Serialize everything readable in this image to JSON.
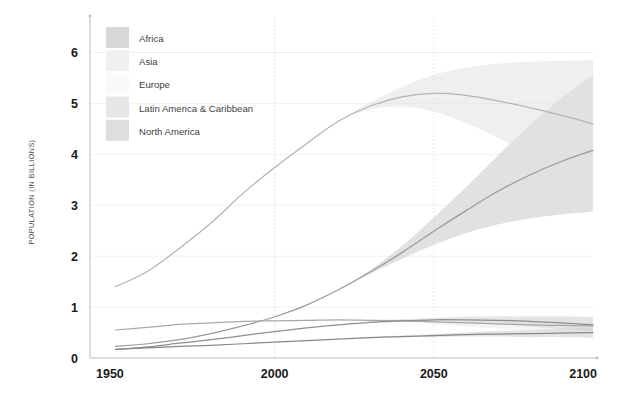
{
  "chart_data": {
    "type": "area",
    "title": "",
    "subtitle": "",
    "xlabel": "",
    "ylabel": "POPULATION (IN BILLIONS)",
    "xlim": [
      1942,
      2100
    ],
    "ylim": [
      0,
      6.6
    ],
    "xticks": [
      "1950",
      "2000",
      "2050",
      "2100"
    ],
    "xtick_values": [
      1950,
      2000,
      2050,
      2100
    ],
    "yticks": [
      "0",
      "1",
      "2",
      "3",
      "4",
      "5",
      "6"
    ],
    "ytick_values": [
      0,
      1,
      2,
      3,
      4,
      5,
      6
    ],
    "grid": "dotted vertical at 2000 and 2050; faint horizontal at 1-6",
    "legend_position": "top-left inside plot",
    "projection_start": 2022,
    "series": [
      {
        "name": "Africa",
        "color": "#9a9a9a",
        "band_color": "#c9c9c9",
        "x": [
          1950,
          1960,
          1970,
          1980,
          1990,
          2000,
          2010,
          2020,
          2030,
          2040,
          2050,
          2060,
          2070,
          2080,
          2090,
          2100
        ],
        "values": [
          0.23,
          0.28,
          0.36,
          0.48,
          0.63,
          0.81,
          1.04,
          1.34,
          1.69,
          2.07,
          2.49,
          2.89,
          3.27,
          3.59,
          3.86,
          4.08
        ],
        "band_low": [
          0.23,
          0.28,
          0.36,
          0.48,
          0.63,
          0.81,
          1.04,
          1.34,
          1.65,
          1.95,
          2.22,
          2.45,
          2.62,
          2.74,
          2.82,
          2.88
        ],
        "band_high": [
          0.23,
          0.28,
          0.36,
          0.48,
          0.63,
          0.81,
          1.04,
          1.34,
          1.73,
          2.2,
          2.76,
          3.35,
          3.97,
          4.56,
          5.1,
          5.56
        ]
      },
      {
        "name": "Asia",
        "color": "#b4b4b4",
        "band_color": "#e2e2e2",
        "x": [
          1950,
          1960,
          1970,
          1980,
          1990,
          2000,
          2010,
          2020,
          2030,
          2040,
          2050,
          2060,
          2070,
          2080,
          2090,
          2100
        ],
        "values": [
          1.4,
          1.7,
          2.15,
          2.65,
          3.23,
          3.74,
          4.21,
          4.65,
          4.95,
          5.13,
          5.2,
          5.16,
          5.05,
          4.92,
          4.77,
          4.6
        ],
        "band_low": [
          1.4,
          1.7,
          2.15,
          2.65,
          3.23,
          3.74,
          4.21,
          4.65,
          4.88,
          4.94,
          4.84,
          4.62,
          4.33,
          4.0,
          3.66,
          3.32
        ],
        "band_high": [
          1.4,
          1.7,
          2.15,
          2.65,
          3.23,
          3.74,
          4.21,
          4.65,
          5.02,
          5.32,
          5.56,
          5.7,
          5.78,
          5.82,
          5.84,
          5.85
        ]
      },
      {
        "name": "Europe",
        "color": "#a8a8a8",
        "band_color": "#ececec",
        "x": [
          1950,
          1960,
          1970,
          1980,
          1990,
          2000,
          2010,
          2020,
          2030,
          2040,
          2050,
          2060,
          2070,
          2080,
          2090,
          2100
        ],
        "values": [
          0.55,
          0.6,
          0.66,
          0.69,
          0.72,
          0.73,
          0.74,
          0.75,
          0.74,
          0.73,
          0.71,
          0.69,
          0.67,
          0.65,
          0.64,
          0.63
        ],
        "band_low": [
          0.55,
          0.6,
          0.66,
          0.69,
          0.72,
          0.73,
          0.74,
          0.75,
          0.73,
          0.7,
          0.66,
          0.62,
          0.58,
          0.54,
          0.51,
          0.48
        ],
        "band_high": [
          0.55,
          0.6,
          0.66,
          0.69,
          0.72,
          0.73,
          0.74,
          0.75,
          0.76,
          0.76,
          0.76,
          0.77,
          0.77,
          0.78,
          0.79,
          0.8
        ]
      },
      {
        "name": "Latin America & Caribbean",
        "color": "#8f8f8f",
        "band_color": "#d3d3d3",
        "x": [
          1950,
          1960,
          1970,
          1980,
          1990,
          2000,
          2010,
          2020,
          2030,
          2040,
          2050,
          2060,
          2070,
          2080,
          2090,
          2100
        ],
        "values": [
          0.17,
          0.22,
          0.29,
          0.36,
          0.44,
          0.52,
          0.59,
          0.65,
          0.7,
          0.73,
          0.75,
          0.75,
          0.74,
          0.72,
          0.69,
          0.65
        ],
        "band_low": [
          0.17,
          0.22,
          0.29,
          0.36,
          0.44,
          0.52,
          0.59,
          0.65,
          0.69,
          0.71,
          0.71,
          0.69,
          0.66,
          0.62,
          0.57,
          0.52
        ],
        "band_high": [
          0.17,
          0.22,
          0.29,
          0.36,
          0.44,
          0.52,
          0.59,
          0.65,
          0.71,
          0.76,
          0.79,
          0.81,
          0.82,
          0.82,
          0.82,
          0.81
        ]
      },
      {
        "name": "North America",
        "color": "#888888",
        "band_color": "#cfcfcf",
        "x": [
          1950,
          1960,
          1970,
          1980,
          1990,
          2000,
          2010,
          2020,
          2030,
          2040,
          2050,
          2060,
          2070,
          2080,
          2090,
          2100
        ],
        "values": [
          0.17,
          0.2,
          0.23,
          0.25,
          0.28,
          0.31,
          0.34,
          0.37,
          0.4,
          0.42,
          0.44,
          0.46,
          0.47,
          0.48,
          0.49,
          0.5
        ],
        "band_low": [
          0.17,
          0.2,
          0.23,
          0.25,
          0.28,
          0.31,
          0.34,
          0.37,
          0.39,
          0.41,
          0.41,
          0.42,
          0.42,
          0.41,
          0.41,
          0.4
        ],
        "band_high": [
          0.17,
          0.2,
          0.23,
          0.25,
          0.28,
          0.31,
          0.34,
          0.37,
          0.41,
          0.44,
          0.47,
          0.5,
          0.53,
          0.55,
          0.58,
          0.6
        ]
      }
    ]
  },
  "legend": {
    "items": [
      {
        "label": "Africa",
        "swatch": "#d7d7d7"
      },
      {
        "label": "Asia",
        "swatch": "#f0f0f0"
      },
      {
        "label": "Europe",
        "swatch": "#fafafa"
      },
      {
        "label": "Latin America & Caribbean",
        "swatch": "#e6e6e6"
      },
      {
        "label": "North America",
        "swatch": "#dedede"
      }
    ]
  },
  "axes": {
    "y_title": "POPULATION (IN BILLIONS)"
  }
}
